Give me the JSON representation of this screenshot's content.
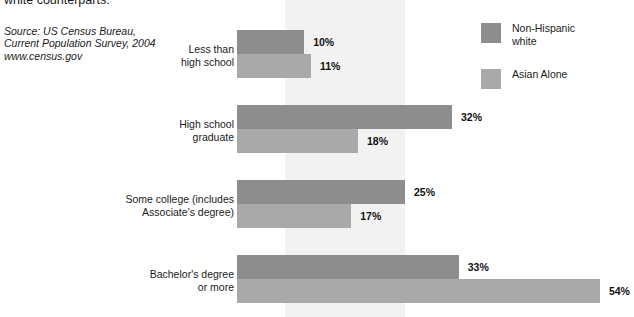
{
  "caption": {
    "tail_line": "white counterparts.",
    "source": [
      "Source: US Census Bureau,",
      "Current Population Survey, 2004",
      "www.census.gov"
    ]
  },
  "legend": {
    "items": [
      {
        "label": "Non-Hispanic\nwhite",
        "color": "#8d8d8d",
        "swatch_name": "legend-swatch-non-hispanic-white"
      },
      {
        "label": "Asian Alone",
        "color": "#a9a9a9",
        "swatch_name": "legend-swatch-asian-alone"
      }
    ]
  },
  "chart_data": {
    "type": "bar",
    "orientation": "horizontal",
    "title": "",
    "xlabel": "",
    "ylabel": "",
    "xlim": [
      0,
      54
    ],
    "grid": false,
    "legend_position": "top-right",
    "value_suffix": "%",
    "categories": [
      "Less than\nhigh school",
      "High school\ngraduate",
      "Some college (includes\nAssociate's degree)",
      "Bachelor's degree\nor more"
    ],
    "series": [
      {
        "name": "Non-Hispanic white",
        "color": "#8d8d8d",
        "values": [
          10,
          32,
          25,
          33
        ]
      },
      {
        "name": "Asian Alone",
        "color": "#a9a9a9",
        "values": [
          11,
          18,
          17,
          54
        ]
      }
    ],
    "value_labels": [
      [
        "10%",
        "32%",
        "25%",
        "33%"
      ],
      [
        "11%",
        "18%",
        "17%",
        "54%"
      ]
    ]
  }
}
